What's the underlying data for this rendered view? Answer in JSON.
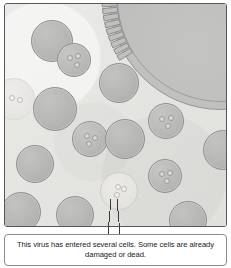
{
  "figure": {
    "caption": "This virus has entered several cells. Some cells are already damaged or dead.",
    "colors": {
      "background": "#e9e9e6",
      "frame_border": "#555759",
      "cell_fill": "#b6b6b5",
      "cell_border": "#8f8f8f",
      "damaged_cell_fill": "#e6e4e1",
      "damaged_cell_border": "#cfcdca",
      "large_cell_fill": "#bcbcbb",
      "caption_background": "#ffffff",
      "caption_border": "#8a8a8a",
      "caption_text": "#1b1b1b",
      "leader_line": "#3a3a3a"
    }
  },
  "scene": {
    "large_cell": {
      "name": "large-cell-upper-right",
      "segment_count": 34
    },
    "cells": [
      {
        "id": "cell-1",
        "state": "normal",
        "cx": 47,
        "cy": 37,
        "r": 21,
        "viruses": []
      },
      {
        "id": "cell-2",
        "state": "infected",
        "cx": 69,
        "cy": 56,
        "r": 17,
        "viruses": [
          [
            -5,
            -3
          ],
          [
            3,
            -5
          ],
          [
            2,
            4
          ]
        ]
      },
      {
        "id": "cell-3",
        "state": "normal",
        "cx": 114,
        "cy": 79,
        "r": 20,
        "viruses": []
      },
      {
        "id": "cell-4",
        "state": "faded",
        "cx": 9,
        "cy": 95,
        "r": 21,
        "viruses": [
          [
            -3,
            -2
          ],
          [
            5,
            0
          ]
        ]
      },
      {
        "id": "cell-5",
        "state": "normal",
        "cx": 50,
        "cy": 105,
        "r": 22,
        "viruses": []
      },
      {
        "id": "cell-6",
        "state": "infected",
        "cx": 161,
        "cy": 117,
        "r": 18,
        "viruses": [
          [
            -5,
            -3
          ],
          [
            4,
            -4
          ],
          [
            1,
            4
          ]
        ]
      },
      {
        "id": "cell-7",
        "state": "infected",
        "cx": 85,
        "cy": 135,
        "r": 18,
        "viruses": [
          [
            -4,
            -4
          ],
          [
            4,
            -2
          ],
          [
            -2,
            4
          ]
        ]
      },
      {
        "id": "cell-8",
        "state": "normal",
        "cx": 120,
        "cy": 135,
        "r": 20,
        "viruses": []
      },
      {
        "id": "cell-9",
        "state": "normal",
        "cx": 218,
        "cy": 146,
        "r": 20,
        "viruses": []
      },
      {
        "id": "cell-10",
        "state": "normal",
        "cx": 30,
        "cy": 160,
        "r": 19,
        "viruses": []
      },
      {
        "id": "cell-11",
        "state": "infected",
        "cx": 160,
        "cy": 172,
        "r": 17,
        "viruses": [
          [
            -4,
            -3
          ],
          [
            4,
            -4
          ],
          [
            1,
            4
          ]
        ]
      },
      {
        "id": "cell-12",
        "state": "damaged",
        "cx": 114,
        "cy": 187,
        "r": 19,
        "viruses": [
          [
            -2,
            -5
          ],
          [
            4,
            -3
          ],
          [
            -3,
            3
          ]
        ]
      },
      {
        "id": "cell-13",
        "state": "normal",
        "cx": 16,
        "cy": 208,
        "r": 20,
        "viruses": []
      },
      {
        "id": "cell-14",
        "state": "normal",
        "cx": 70,
        "cy": 211,
        "r": 19,
        "viruses": []
      },
      {
        "id": "cell-15",
        "state": "normal",
        "cx": 183,
        "cy": 216,
        "r": 19,
        "viruses": []
      }
    ],
    "callout": {
      "name": "virus-callout",
      "target_cell": "cell-12",
      "leader_lines": [
        {
          "x1": 111,
          "y1": 199,
          "x2": 108,
          "y2": 234
        },
        {
          "x1": 117,
          "y1": 199,
          "x2": 120,
          "y2": 234
        }
      ]
    }
  }
}
